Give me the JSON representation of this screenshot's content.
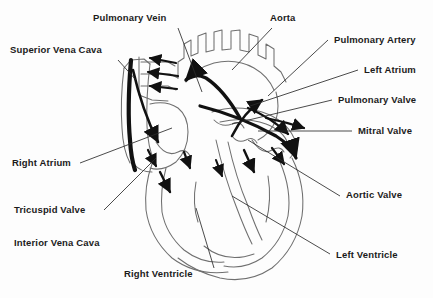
{
  "diagram": {
    "background_color": "#fdfdfd",
    "outline_color": "#6f6f6f",
    "accent_color": "#111111",
    "label_color": "#1b1b1b"
  },
  "labels": {
    "pulmonary_vein": "Pulmonary Vein",
    "aorta": "Aorta",
    "superior_vena_cava": "Superior Vena Cava",
    "pulmonary_artery": "Pulmonary Artery",
    "left_atrium": "Left Atrium",
    "pulmonary_valve": "Pulmonary Valve",
    "mitral_valve": "Mitral Valve",
    "right_atrium": "Right Atrium",
    "aortic_valve": "Aortic Valve",
    "tricuspid_valve": "Tricuspid Valve",
    "interior_vena_cava": "Interior Vena Cava",
    "right_ventricle": "Right Ventricle",
    "left_ventricle": "Left Ventricle"
  }
}
